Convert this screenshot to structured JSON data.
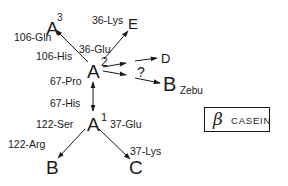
{
  "diagram": {
    "title_box": {
      "symbol": "β",
      "label": "CASEIN"
    },
    "nodes": {
      "A3": {
        "label": "A",
        "sup": "3"
      },
      "A2": {
        "label": "A",
        "sup": "2"
      },
      "A1": {
        "label": "A",
        "sup": "1"
      },
      "E": {
        "label": "E"
      },
      "D": {
        "label": "D"
      },
      "BZebu": {
        "label": "B",
        "sub": "Zebu"
      },
      "B": {
        "label": "B"
      },
      "C": {
        "label": "C"
      }
    },
    "edges": [
      {
        "from": "A2",
        "to": "A3",
        "from_label": "106-His",
        "to_label": "106-Gln"
      },
      {
        "from": "A2",
        "to": "E",
        "from_label": "36-Glu",
        "to_label": "36-Lys"
      },
      {
        "from": "A2",
        "to": "D",
        "label": ""
      },
      {
        "from": "A2",
        "to": "BZebu",
        "label": "?"
      },
      {
        "from": "A2",
        "to": "A1",
        "from_label": "67-Pro",
        "to_label": "67-His",
        "bidirectional": true
      },
      {
        "from": "A1",
        "to": "B",
        "from_label": "122-Ser",
        "to_label": "122-Arg"
      },
      {
        "from": "A1",
        "to": "C",
        "from_label": "37-Glu",
        "to_label": "37-Lys"
      }
    ],
    "labels": {
      "gln106": "106-Gln",
      "lys36": "36-Lys",
      "his106": "106-His",
      "glu36": "36-Glu",
      "question": "?",
      "pro67": "67-Pro",
      "his67": "67-His",
      "ser122": "122-Ser",
      "glu37": "37-Glu",
      "arg122": "122-Arg",
      "lys37": "37-Lys"
    },
    "line_color": "#1a1a1a"
  }
}
